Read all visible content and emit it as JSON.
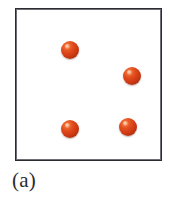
{
  "figure": {
    "caption": "(a)",
    "box": {
      "border_color": "#2c2c30",
      "fill_color": "#ffffff",
      "left": 15,
      "top": 8,
      "width": 147,
      "height": 153
    }
  },
  "chart_data": {
    "type": "scatter",
    "title": "(a)",
    "subtitle": "",
    "xlabel": "",
    "ylabel": "",
    "xlim": [
      0,
      147
    ],
    "ylim": [
      0,
      153
    ],
    "grid": false,
    "legend": null,
    "annotations": [
      "(a)"
    ],
    "series": [
      {
        "name": "particle",
        "marker": "sphere",
        "color": "#d63f18",
        "highlight_color": "#f79a6a",
        "shadow_color": "#8d2409",
        "count": 4,
        "marker_size_px": 18,
        "points": [
          {
            "id": "particle-1",
            "x": 45,
            "y": 32,
            "d": 18
          },
          {
            "id": "particle-2",
            "x": 107,
            "y": 58,
            "d": 18
          },
          {
            "id": "particle-3",
            "x": 45,
            "y": 111,
            "d": 18
          },
          {
            "id": "particle-4",
            "x": 103,
            "y": 109,
            "d": 18
          }
        ]
      }
    ]
  },
  "particles": [
    {
      "label": "particle-1",
      "left": "45px",
      "top": "32px",
      "size": "18px"
    },
    {
      "label": "particle-2",
      "left": "107px",
      "top": "58px",
      "size": "18px"
    },
    {
      "label": "particle-3",
      "left": "45px",
      "top": "111px",
      "size": "18px"
    },
    {
      "label": "particle-4",
      "left": "103px",
      "top": "109px",
      "size": "18px"
    }
  ]
}
